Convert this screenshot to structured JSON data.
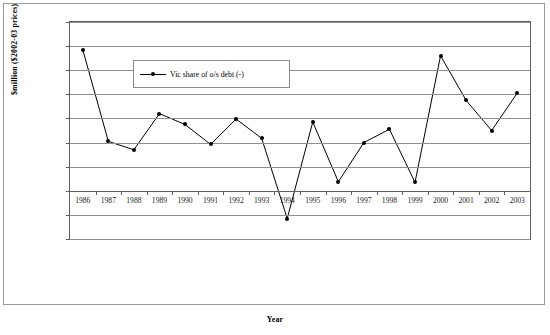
{
  "chart_data": {
    "type": "line",
    "title": "",
    "xlabel": "Year",
    "ylabel": "$million ($2002-03 prices)",
    "categories": [
      "1986",
      "1987",
      "1988",
      "1989",
      "1990",
      "1991",
      "1992",
      "1993",
      "1994",
      "1995",
      "1996",
      "1997",
      "1998",
      "1999",
      "2000",
      "2001",
      "2002",
      "2003"
    ],
    "series": [
      {
        "name": "Vic share of o/s debt (-)",
        "values": [
          11700,
          4100,
          3400,
          6400,
          5500,
          3850,
          5950,
          4350,
          -2300,
          5700,
          750,
          4000,
          5100,
          700,
          11200,
          7500,
          5000,
          8100
        ]
      }
    ],
    "ylim": [
      -4000,
      14000
    ],
    "ytick_values": [
      14000,
      12000,
      10000,
      8000,
      6000,
      4000,
      2000,
      0,
      -2000,
      -4000
    ],
    "ytick_labels": [
      "14,000.0",
      "12,000.0",
      "10,000.0",
      "8,000.0",
      "6,000.0",
      "4,000.0",
      "2,000.0",
      "0.0",
      "-2,000.0",
      "-4,000.0"
    ],
    "grid": true,
    "legend_position": "inside-top-left",
    "marker": "filled-circle",
    "line_color": "#000000",
    "grid_color": "#8f8f8f",
    "axis_color": "#5f5f5f",
    "background": "#ffffff"
  },
  "legend": {
    "entries": [
      {
        "label": "Vic share of o/s debt (-)"
      }
    ]
  },
  "axes": {
    "x_title": "Year",
    "y_title": "$million ($2002-03 prices)"
  }
}
